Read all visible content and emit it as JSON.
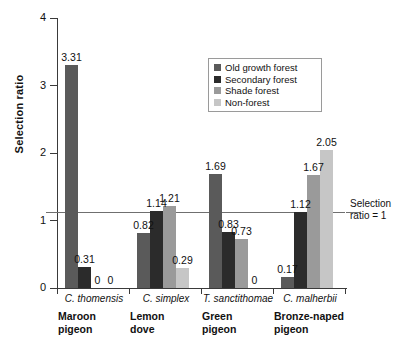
{
  "chart_data": {
    "type": "bar",
    "title": "",
    "xlabel": "",
    "ylabel": "Selection ratio",
    "ylim": [
      0,
      4
    ],
    "ytick_labels": [
      "0",
      "1",
      "2",
      "3",
      "4"
    ],
    "grid": false,
    "legend_position": "upper-center-right",
    "categories": [
      "C. thomensis",
      "C. simplex",
      "T. sanctithomae",
      "C. malherbii"
    ],
    "category_common_names": [
      "Maroon pigeon",
      "Lemon dove",
      "Green pigeon",
      "Bronze-naped pigeon"
    ],
    "series": [
      {
        "name": "Old growth forest",
        "color": "#5a5a5a",
        "values": [
          3.31,
          0.82,
          1.69,
          0.17
        ]
      },
      {
        "name": "Secondary forest",
        "color": "#2b2b2b",
        "values": [
          0.31,
          1.14,
          0.83,
          1.12
        ]
      },
      {
        "name": "Shade forest",
        "color": "#9a9a9a",
        "values": [
          0,
          1.21,
          0.73,
          1.67
        ]
      },
      {
        "name": "Non-forest",
        "color": "#c6c6c6",
        "values": [
          0,
          0.29,
          0,
          2.05
        ]
      }
    ],
    "annotations": [
      {
        "name": "reference-line",
        "text": "Selection ratio = 1",
        "value": 1
      }
    ]
  },
  "axis": {
    "y_title": "Selection ratio",
    "y_ticks": [
      {
        "label": "4",
        "value": 4
      },
      {
        "label": "3",
        "value": 3
      },
      {
        "label": "2",
        "value": 2
      },
      {
        "label": "1",
        "value": 1
      },
      {
        "label": "0",
        "value": 0
      }
    ]
  },
  "legend": {
    "items": [
      {
        "label": "Old growth forest",
        "color": "#5a5a5a"
      },
      {
        "label": "Secondary forest",
        "color": "#2b2b2b"
      },
      {
        "label": "Shade forest",
        "color": "#9a9a9a"
      },
      {
        "label": "Non-forest",
        "color": "#c6c6c6"
      }
    ]
  },
  "reference": {
    "line_1": "Selection",
    "line_2": "ratio = 1"
  },
  "groups": [
    {
      "scientific": "C. thomensis",
      "common_line_1": "Maroon",
      "common_line_2": "pigeon",
      "bars": [
        {
          "series": "Old growth forest",
          "value": 3.31,
          "label": "3.31"
        },
        {
          "series": "Secondary forest",
          "value": 0.31,
          "label": "0.31"
        },
        {
          "series": "Shade forest",
          "value": 0,
          "label": "0"
        },
        {
          "series": "Non-forest",
          "value": 0,
          "label": "0"
        }
      ]
    },
    {
      "scientific": "C. simplex",
      "common_line_1": "Lemon",
      "common_line_2": "dove",
      "bars": [
        {
          "series": "Old growth forest",
          "value": 0.82,
          "label": "0.82"
        },
        {
          "series": "Secondary forest",
          "value": 1.14,
          "label": "1.14"
        },
        {
          "series": "Shade forest",
          "value": 1.21,
          "label": "1.21"
        },
        {
          "series": "Non-forest",
          "value": 0.29,
          "label": "0.29"
        }
      ]
    },
    {
      "scientific": "T. sanctithomae",
      "common_line_1": "Green",
      "common_line_2": "pigeon",
      "bars": [
        {
          "series": "Old growth forest",
          "value": 1.69,
          "label": "1.69"
        },
        {
          "series": "Secondary forest",
          "value": 0.83,
          "label": "0.83"
        },
        {
          "series": "Shade forest",
          "value": 0.73,
          "label": "0.73"
        },
        {
          "series": "Non-forest",
          "value": 0,
          "label": "0"
        }
      ]
    },
    {
      "scientific": "C. malherbii",
      "common_line_1": "Bronze-naped",
      "common_line_2": "pigeon",
      "bars": [
        {
          "series": "Old growth forest",
          "value": 0.17,
          "label": "0.17"
        },
        {
          "series": "Secondary forest",
          "value": 1.12,
          "label": "1.12"
        },
        {
          "series": "Shade forest",
          "value": 1.67,
          "label": "1.67"
        },
        {
          "series": "Non-forest",
          "value": 2.05,
          "label": "2.05"
        }
      ]
    }
  ]
}
